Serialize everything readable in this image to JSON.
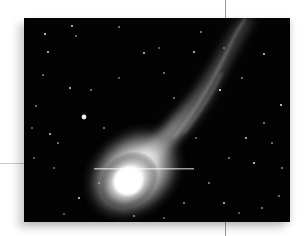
{
  "image": {
    "subject": "comet",
    "description": "Black-and-white photograph of a comet with a bright coma and a long streaming tail against a starfield",
    "colors": {
      "sky": "#030303",
      "coma": "#ffffff",
      "tail": "#bdbdbd",
      "stars": "#e8e8e8",
      "page": "#ffffff",
      "guide_lines": "#9a9a9a"
    }
  }
}
